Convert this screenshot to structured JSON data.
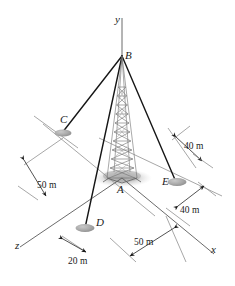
{
  "figure": {
    "type": "engineering-statics-diagram",
    "background_color": "#ffffff",
    "line_color": "#1a1a1a",
    "axis_color": "#555555",
    "tower_color": "#6b6b6b",
    "shadow_color": "#b8b8b8"
  },
  "axes": [
    {
      "name": "y-axis",
      "label": "y"
    },
    {
      "name": "x-axis",
      "label": "x"
    },
    {
      "name": "z-axis",
      "label": "z"
    }
  ],
  "points": [
    {
      "name": "point-b",
      "label": "B",
      "role": "tower top / cable attachment"
    },
    {
      "name": "point-c",
      "label": "C",
      "role": "guy anchor"
    },
    {
      "name": "point-a",
      "label": "A",
      "role": "tower base at origin"
    },
    {
      "name": "point-e",
      "label": "E",
      "role": "guy anchor"
    },
    {
      "name": "point-d",
      "label": "D",
      "role": "guy anchor"
    }
  ],
  "dimensions": [
    {
      "name": "dimension-50m-left",
      "label": "50 m"
    },
    {
      "name": "dimension-40m-upper-right",
      "label": "40 m"
    },
    {
      "name": "dimension-40m-lower-right",
      "label": "40 m"
    },
    {
      "name": "dimension-20m-bottom-left",
      "label": "20 m"
    },
    {
      "name": "dimension-50m-bottom",
      "label": "50 m"
    }
  ]
}
